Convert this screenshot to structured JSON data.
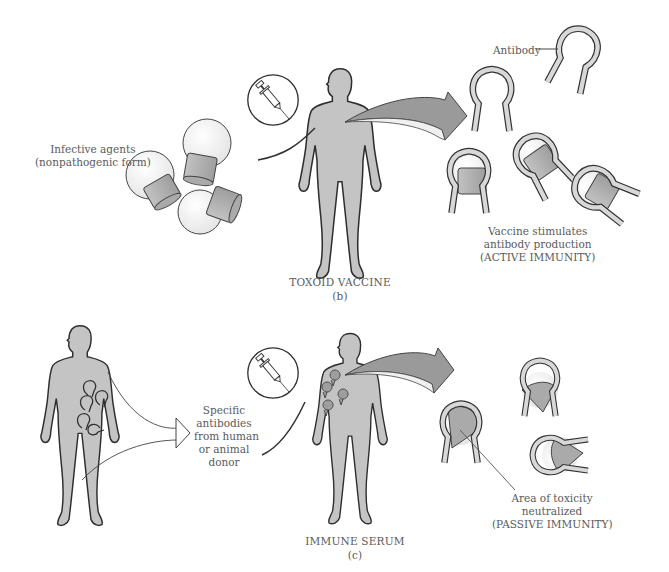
{
  "panel_b": {
    "infective_agents_label": [
      "Infective agents",
      "(nonpathogenic form)"
    ],
    "antibody_label": "Antibody",
    "result_label": [
      "Vaccine stimulates",
      "antibody production",
      "(ACTIVE IMMUNITY)"
    ],
    "title": "TOXOID VACCINE",
    "panel_letter": "(b)"
  },
  "panel_c": {
    "donor_label": [
      "Specific",
      "antibodies",
      "from human",
      "or animal",
      "donor"
    ],
    "result_label": [
      "Area of toxicity",
      "neutralized",
      "(PASSIVE IMMUNITY)"
    ],
    "title": "IMMUNE SERUM",
    "panel_letter": "(c)"
  },
  "colors": {
    "body_fill": "#c4c4c4",
    "outline": "#333333",
    "arrow_fill": "#9a9a9a",
    "antigen_fill": "#b5b5b5",
    "text": "#5a5a5a"
  }
}
